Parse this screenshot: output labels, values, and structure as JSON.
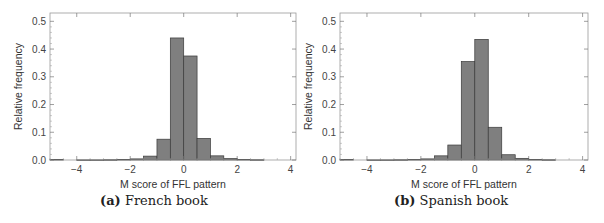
{
  "figure": {
    "panels": [
      {
        "caption_tag": "(a)",
        "caption_text": "French book",
        "xlabel": "M score of FFL pattern",
        "ylabel": "Relative frequency"
      },
      {
        "caption_tag": "(b)",
        "caption_text": "Spanish book",
        "xlabel": "M score of FFL pattern",
        "ylabel": "Relative frequency"
      }
    ]
  },
  "chart_data": [
    {
      "type": "bar",
      "title": "(a) French book",
      "xlabel": "M score of FFL pattern",
      "ylabel": "Relative frequency",
      "xlim": [
        -5,
        4.2
      ],
      "ylim": [
        0,
        0.53
      ],
      "xticks": [
        -4,
        -2,
        0,
        2,
        4
      ],
      "xtick_labels": [
        "−4",
        "−2",
        "0",
        "2",
        "4"
      ],
      "yticks": [
        0.0,
        0.1,
        0.2,
        0.3,
        0.4,
        0.5
      ],
      "ytick_labels": [
        "0.0",
        "0.1",
        "0.2",
        "0.3",
        "0.4",
        "0.5"
      ],
      "grid": false,
      "bin_width": 0.5,
      "bin_starts": [
        -5.0,
        -4.5,
        -4.0,
        -3.5,
        -3.0,
        -2.5,
        -2.0,
        -1.5,
        -1.0,
        -0.5,
        0.0,
        0.5,
        1.0,
        1.5,
        2.0,
        2.5,
        3.0,
        3.5
      ],
      "values": [
        0.002,
        0.0,
        0.0005,
        0.0005,
        0.001,
        0.002,
        0.004,
        0.014,
        0.075,
        0.44,
        0.375,
        0.078,
        0.015,
        0.005,
        0.002,
        0.001,
        0.0,
        0.0
      ],
      "bar_color": "#7f7f7f",
      "edge_color": "#3a3a3a"
    },
    {
      "type": "bar",
      "title": "(b) Spanish book",
      "xlabel": "M score of FFL pattern",
      "ylabel": "Relative frequency",
      "xlim": [
        -5,
        4.2
      ],
      "ylim": [
        0,
        0.53
      ],
      "xticks": [
        -4,
        -2,
        0,
        2,
        4
      ],
      "xtick_labels": [
        "−4",
        "−2",
        "0",
        "2",
        "4"
      ],
      "yticks": [
        0.0,
        0.1,
        0.2,
        0.3,
        0.4,
        0.5
      ],
      "ytick_labels": [
        "0.0",
        "0.1",
        "0.2",
        "0.3",
        "0.4",
        "0.5"
      ],
      "grid": false,
      "bin_width": 0.5,
      "bin_starts": [
        -5.0,
        -4.5,
        -4.0,
        -3.5,
        -3.0,
        -2.5,
        -2.0,
        -1.5,
        -1.0,
        -0.5,
        0.0,
        0.5,
        1.0,
        1.5,
        2.0,
        2.5,
        3.0,
        3.5
      ],
      "values": [
        0.002,
        0.0,
        0.0005,
        0.0005,
        0.001,
        0.002,
        0.004,
        0.015,
        0.054,
        0.355,
        0.435,
        0.118,
        0.019,
        0.006,
        0.002,
        0.001,
        0.0,
        0.0
      ],
      "bar_color": "#7f7f7f",
      "edge_color": "#3a3a3a"
    }
  ]
}
